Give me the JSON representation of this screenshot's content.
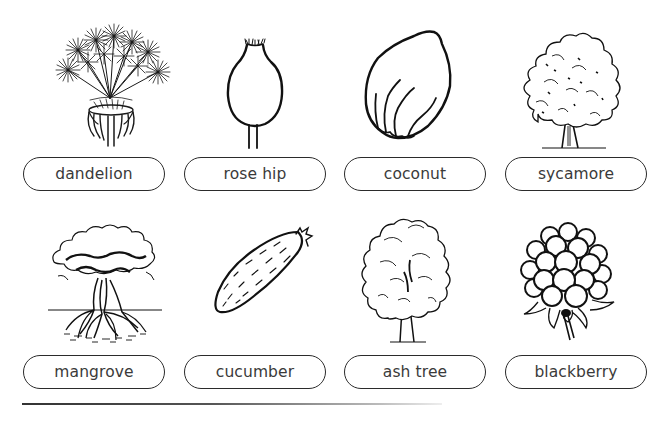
{
  "items": [
    {
      "label": "dandelion",
      "icon": "dandelion-icon"
    },
    {
      "label": "rose hip",
      "icon": "rose-hip-icon"
    },
    {
      "label": "coconut",
      "icon": "coconut-icon"
    },
    {
      "label": "sycamore",
      "icon": "sycamore-tree-icon"
    },
    {
      "label": "mangrove",
      "icon": "mangrove-tree-icon"
    },
    {
      "label": "cucumber",
      "icon": "cucumber-icon"
    },
    {
      "label": "ash tree",
      "icon": "ash-tree-icon"
    },
    {
      "label": "blackberry",
      "icon": "blackberry-icon"
    }
  ],
  "colors": {
    "ink": "#2b2b2b",
    "text": "#3a3a3a",
    "background": "#ffffff"
  }
}
